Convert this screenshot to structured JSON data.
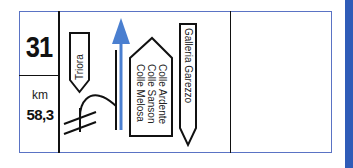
{
  "sign": {
    "road_number": "31",
    "km_label": "km",
    "km_value": "58,3",
    "left_direction": "Triora",
    "straight_destinations": [
      "Colle Ardente",
      "Colle Sanson",
      "Colle Melosa"
    ],
    "right_direction": "Galleria Garezzo"
  },
  "colors": {
    "frame_border": "#5a73c4",
    "arrow_blue": "#4a7fd0",
    "side_bar": "#2f5cb8",
    "ink": "#111111"
  }
}
